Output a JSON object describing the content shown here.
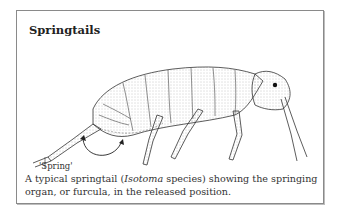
{
  "box": {
    "title": "Springtails",
    "illustration": {
      "subject": "springtail side-view line drawing",
      "label": "'Spring'"
    },
    "caption": {
      "before": "A typical springtail (",
      "italic": "Isotoma",
      "after": " species) showing the springing organ, or furcula, in the released position."
    }
  }
}
